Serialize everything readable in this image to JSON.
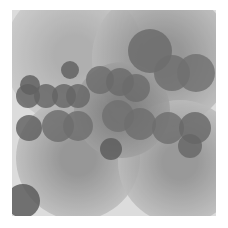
{
  "image": {
    "description": "Abstract grayscale field of overlapping radial-gradient circles",
    "background": "#ffffff",
    "field": {
      "x": 12,
      "y": 10,
      "width": 204,
      "height": 206,
      "base_color": "#dcdcdc"
    }
  },
  "halos": [
    {
      "cx": 62,
      "cy": 45,
      "r": 70,
      "inner": "#a8a8a8",
      "outer": "#dadada"
    },
    {
      "cx": 150,
      "cy": 48,
      "r": 70,
      "inner": "#8a8a8a",
      "outer": "#d4d4d4"
    },
    {
      "cx": 66,
      "cy": 148,
      "r": 62,
      "inner": "#8c8c8c",
      "outer": "#d6d6d6"
    },
    {
      "cx": 168,
      "cy": 152,
      "r": 62,
      "inner": "#8e8e8e",
      "outer": "#d6d6d6"
    },
    {
      "cx": 110,
      "cy": 100,
      "r": 48,
      "inner": "#7c7c7c",
      "outer": "#b4b4b4"
    }
  ],
  "circles": [
    {
      "cx": 138,
      "cy": 41,
      "r": 22,
      "color": "#6a6a6a"
    },
    {
      "cx": 58,
      "cy": 60,
      "r": 9,
      "color": "#5e5e5e"
    },
    {
      "cx": 18,
      "cy": 75,
      "r": 10,
      "color": "#5c5c5c"
    },
    {
      "cx": 16,
      "cy": 86,
      "r": 12,
      "color": "#606060"
    },
    {
      "cx": 34,
      "cy": 86,
      "r": 12,
      "color": "#636363"
    },
    {
      "cx": 52,
      "cy": 86,
      "r": 12,
      "color": "#646464"
    },
    {
      "cx": 66,
      "cy": 86,
      "r": 12,
      "color": "#666666"
    },
    {
      "cx": 88,
      "cy": 70,
      "r": 14,
      "color": "#6c6c6c"
    },
    {
      "cx": 108,
      "cy": 72,
      "r": 14,
      "color": "#6a6a6a"
    },
    {
      "cx": 124,
      "cy": 78,
      "r": 14,
      "color": "#6c6c6c"
    },
    {
      "cx": 160,
      "cy": 63,
      "r": 18,
      "color": "#6e6e6e"
    },
    {
      "cx": 184,
      "cy": 63,
      "r": 19,
      "color": "#707070"
    },
    {
      "cx": 106,
      "cy": 106,
      "r": 16,
      "color": "#707070"
    },
    {
      "cx": 46,
      "cy": 116,
      "r": 16,
      "color": "#6c6c6c"
    },
    {
      "cx": 66,
      "cy": 116,
      "r": 15,
      "color": "#6e6e6e"
    },
    {
      "cx": 17,
      "cy": 118,
      "r": 13,
      "color": "#5e5e5e"
    },
    {
      "cx": 128,
      "cy": 114,
      "r": 16,
      "color": "#6e6e6e"
    },
    {
      "cx": 156,
      "cy": 118,
      "r": 16,
      "color": "#6e6e6e"
    },
    {
      "cx": 183,
      "cy": 118,
      "r": 16,
      "color": "#686868"
    },
    {
      "cx": 178,
      "cy": 136,
      "r": 12,
      "color": "#666666"
    },
    {
      "cx": 99,
      "cy": 139,
      "r": 11,
      "color": "#5a5a5a"
    },
    {
      "cx": 11,
      "cy": 191,
      "r": 17,
      "color": "#565656"
    }
  ]
}
